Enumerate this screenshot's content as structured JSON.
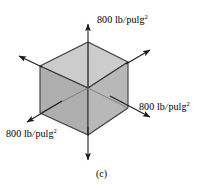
{
  "figure": {
    "caption": "(c)",
    "shape": "cube",
    "projection": "isometric",
    "colors": {
      "top_face": "#c9c9c9",
      "left_face": "#a9a9a9",
      "right_face": "#b4b4b4",
      "edge": "#3a3a3a",
      "hidden_edge": "#6e6e6e",
      "arrow": "#1a1a1a",
      "background": "#ffffff"
    },
    "labels": {
      "top": {
        "value": "800",
        "unit_numerator": "lb",
        "unit_slash": "/",
        "unit_denominator": "pulg",
        "exponent": "2"
      },
      "right": {
        "value": "800",
        "unit_numerator": "lb",
        "unit_slash": "/",
        "unit_denominator": "pulg",
        "exponent": "2"
      },
      "left": {
        "value": "800",
        "unit_numerator": "lb",
        "unit_slash": "/",
        "unit_denominator": "pulg",
        "exponent": "2"
      }
    },
    "arrows": [
      {
        "name": "arrow-up",
        "direction": "up",
        "labelled": true
      },
      {
        "name": "arrow-down",
        "direction": "down",
        "labelled": false
      },
      {
        "name": "arrow-right-down",
        "direction": "down-right",
        "labelled": true
      },
      {
        "name": "arrow-left-down",
        "direction": "down-left",
        "labelled": true
      },
      {
        "name": "arrow-upper-right",
        "direction": "up-right",
        "labelled": false
      },
      {
        "name": "arrow-upper-left",
        "direction": "up-left",
        "labelled": false
      }
    ]
  }
}
